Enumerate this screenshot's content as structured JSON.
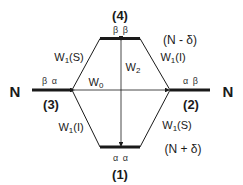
{
  "diagram": {
    "levels": [
      {
        "id": "1",
        "number_label": "(1)",
        "spin_label": "α α",
        "population_label": "(N + δ)"
      },
      {
        "id": "2",
        "number_label": "(2)",
        "spin_label": "α β",
        "population_label": "N"
      },
      {
        "id": "3",
        "number_label": "(3)",
        "spin_label": "β α",
        "population_label": "N"
      },
      {
        "id": "4",
        "number_label": "(4)",
        "spin_label": "β β",
        "population_label": "(N - δ)"
      }
    ],
    "transitions": [
      {
        "from": "3",
        "to": "4",
        "label": "W",
        "sub": "1",
        "suffix": "(S)"
      },
      {
        "from": "4",
        "to": "2",
        "label": "W",
        "sub": "1",
        "suffix": "(I)"
      },
      {
        "from": "1",
        "to": "3",
        "label": "W",
        "sub": "1",
        "suffix": "(I)"
      },
      {
        "from": "1",
        "to": "2",
        "label": "W",
        "sub": "1",
        "suffix": "(S)"
      },
      {
        "from": "3",
        "to": "2",
        "label": "W",
        "sub": "0",
        "suffix": ""
      },
      {
        "from": "1",
        "to": "4",
        "label": "W",
        "sub": "2",
        "suffix": ""
      }
    ],
    "colors": {
      "line": "#1a1a1a",
      "text": "#1a1a1a"
    }
  }
}
